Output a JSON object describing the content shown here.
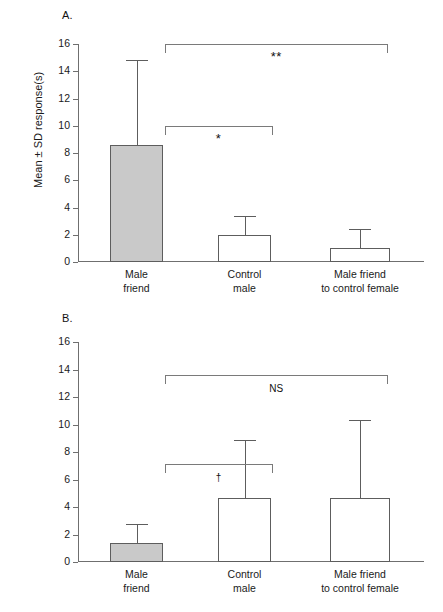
{
  "figure": {
    "y_axis_title": "Mean ± SD response(s)",
    "panels": [
      {
        "letter": "A.",
        "name": "panel-a"
      },
      {
        "letter": "B.",
        "name": "panel-b"
      }
    ]
  },
  "chart_data": [
    {
      "type": "bar",
      "panel": "A",
      "title": "A.",
      "xlabel": "",
      "ylabel": "Mean ± SD response(s)",
      "ylim": [
        0,
        16
      ],
      "yticks": [
        0,
        2,
        4,
        6,
        8,
        10,
        12,
        14,
        16
      ],
      "ytick_labels": [
        "0",
        "2",
        "4",
        "6",
        "8",
        "10",
        "12",
        "14",
        "16"
      ],
      "grid": false,
      "legend": "none",
      "categories": [
        "Male friend",
        "Control male",
        "Male friend to control female"
      ],
      "category_lines": [
        [
          "Male",
          "friend"
        ],
        [
          "Control",
          "male"
        ],
        [
          "Male friend",
          "to control female"
        ]
      ],
      "values": [
        8.6,
        1.95,
        1.0
      ],
      "errors": [
        6.2,
        1.45,
        1.4
      ],
      "error_tops": [
        14.8,
        3.4,
        2.4
      ],
      "bar_fill": [
        "#c9c9c9",
        "#ffffff",
        "#ffffff"
      ],
      "annotations": [
        {
          "label": "**",
          "from": 0,
          "to": 2,
          "y": 16.0,
          "kind": "significance-bracket"
        },
        {
          "label": "*",
          "from": 0,
          "to": 1,
          "y": 10.0,
          "kind": "significance-bracket"
        }
      ]
    },
    {
      "type": "bar",
      "panel": "B",
      "title": "B.",
      "xlabel": "",
      "ylabel": "Mean ± SD response(s)",
      "ylim": [
        0,
        16
      ],
      "yticks": [
        0,
        2,
        4,
        6,
        8,
        10,
        12,
        14,
        16
      ],
      "ytick_labels": [
        "0",
        "2",
        "4",
        "6",
        "8",
        "10",
        "12",
        "14",
        "16"
      ],
      "grid": false,
      "legend": "none",
      "categories": [
        "Male friend",
        "Control male",
        "Male friend to control female"
      ],
      "category_lines": [
        [
          "Male",
          "friend"
        ],
        [
          "Control",
          "male"
        ],
        [
          "Male friend",
          "to control female"
        ]
      ],
      "values": [
        1.4,
        4.65,
        4.65
      ],
      "errors": [
        1.4,
        4.25,
        5.65
      ],
      "error_tops": [
        2.8,
        8.9,
        10.3
      ],
      "bar_fill": [
        "#c9c9c9",
        "#ffffff",
        "#ffffff"
      ],
      "annotations": [
        {
          "label": "NS",
          "from": 0,
          "to": 2,
          "y": 13.6,
          "kind": "significance-bracket"
        },
        {
          "label": "†",
          "from": 0,
          "to": 1,
          "y": 7.1,
          "kind": "significance-bracket"
        }
      ]
    }
  ],
  "colors": {
    "bar_filled": "#c9c9c9",
    "bar_open": "#ffffff",
    "axis": "#6f6f6f",
    "bar_edge": "#5d5d5d",
    "bracket": "#7a7a7a",
    "text": "#1a1a1a"
  }
}
